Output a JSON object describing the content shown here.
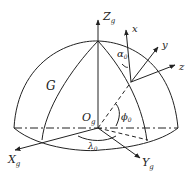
{
  "diagram": {
    "labels": {
      "global_z": "Z",
      "global_z_sub": "g",
      "global_x": "X",
      "global_x_sub": "g",
      "global_y": "Y",
      "global_y_sub": "g",
      "origin": "O",
      "origin_sub": "g",
      "local_x": "x",
      "local_y": "y",
      "local_z": "z",
      "alpha": "α",
      "alpha_sub": "0",
      "phi": "ϕ",
      "phi_sub": "0",
      "lambda": "λ",
      "lambda_sub": "0",
      "surface": "G"
    },
    "colors": {
      "stroke": "#222222",
      "background": "#ffffff"
    }
  }
}
